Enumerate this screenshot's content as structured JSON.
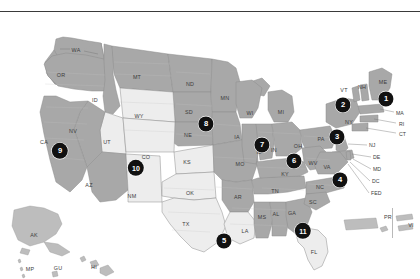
{
  "figure": {
    "colors": {
      "shaded_state_fill": "#a8a8a8",
      "unshaded_state_fill": "#ededed",
      "state_border": "#8c8c8c",
      "county_line": "#c9c9c9",
      "marker_fill": "#111111",
      "marker_text": "#ffffff",
      "background": "#ffffff",
      "rule": "#3a3a3a"
    }
  },
  "markers": [
    {
      "label": "1",
      "x": 386,
      "y": 87,
      "r": 7.6,
      "name": "region-marker-1"
    },
    {
      "label": "2",
      "x": 343,
      "y": 93,
      "r": 7.6,
      "name": "region-marker-2"
    },
    {
      "label": "3",
      "x": 337,
      "y": 125,
      "r": 7.6,
      "name": "region-marker-3"
    },
    {
      "label": "4",
      "x": 340,
      "y": 168,
      "r": 7.6,
      "name": "region-marker-4"
    },
    {
      "label": "5",
      "x": 224,
      "y": 229,
      "r": 7.6,
      "name": "region-marker-5"
    },
    {
      "label": "6",
      "x": 294,
      "y": 149,
      "r": 7.6,
      "name": "region-marker-6"
    },
    {
      "label": "7",
      "x": 262,
      "y": 133,
      "r": 7.6,
      "name": "region-marker-7"
    },
    {
      "label": "8",
      "x": 206,
      "y": 112,
      "r": 7.6,
      "name": "region-marker-8"
    },
    {
      "label": "9",
      "x": 60,
      "y": 139,
      "r": 8.2,
      "name": "region-marker-9"
    },
    {
      "label": "10",
      "x": 136,
      "y": 156,
      "r": 8.2,
      "name": "region-marker-10"
    },
    {
      "label": "11",
      "x": 303,
      "y": 219,
      "r": 8.2,
      "name": "region-marker-11"
    }
  ],
  "state_labels": [
    {
      "text": "WA",
      "x": 76,
      "y": 38
    },
    {
      "text": "OR",
      "x": 61,
      "y": 63
    },
    {
      "text": "ID",
      "x": 95,
      "y": 88
    },
    {
      "text": "MT",
      "x": 137,
      "y": 65
    },
    {
      "text": "ND",
      "x": 190,
      "y": 72
    },
    {
      "text": "SD",
      "x": 189,
      "y": 100
    },
    {
      "text": "NE",
      "x": 188,
      "y": 123
    },
    {
      "text": "MN",
      "x": 225,
      "y": 86
    },
    {
      "text": "WY",
      "x": 139,
      "y": 104
    },
    {
      "text": "UT",
      "x": 107,
      "y": 130
    },
    {
      "text": "NV",
      "x": 73,
      "y": 119
    },
    {
      "text": "CA",
      "x": 44,
      "y": 130
    },
    {
      "text": "AZ",
      "x": 89,
      "y": 173
    },
    {
      "text": "NM",
      "x": 132,
      "y": 184
    },
    {
      "text": "CO",
      "x": 146,
      "y": 145
    },
    {
      "text": "KS",
      "x": 187,
      "y": 150
    },
    {
      "text": "OK",
      "x": 190,
      "y": 181
    },
    {
      "text": "TX",
      "x": 186,
      "y": 212
    },
    {
      "text": "IA",
      "x": 237,
      "y": 125
    },
    {
      "text": "MO",
      "x": 240,
      "y": 152
    },
    {
      "text": "AR",
      "x": 238,
      "y": 185
    },
    {
      "text": "LA",
      "x": 245,
      "y": 219
    },
    {
      "text": "MS",
      "x": 262,
      "y": 205
    },
    {
      "text": "AL",
      "x": 276,
      "y": 202
    },
    {
      "text": "GA",
      "x": 292,
      "y": 201
    },
    {
      "text": "FL",
      "x": 314,
      "y": 240
    },
    {
      "text": "TN",
      "x": 275,
      "y": 179
    },
    {
      "text": "KY",
      "x": 285,
      "y": 162
    },
    {
      "text": "WI",
      "x": 250,
      "y": 101
    },
    {
      "text": "MI",
      "x": 281,
      "y": 100
    },
    {
      "text": "IL",
      "x": 259,
      "y": 140
    },
    {
      "text": "IN",
      "x": 274,
      "y": 138
    },
    {
      "text": "OH",
      "x": 298,
      "y": 134
    },
    {
      "text": "WV",
      "x": 313,
      "y": 151
    },
    {
      "text": "VA",
      "x": 327,
      "y": 155
    },
    {
      "text": "NC",
      "x": 320,
      "y": 175
    },
    {
      "text": "SC",
      "x": 313,
      "y": 190
    },
    {
      "text": "PA",
      "x": 321,
      "y": 127
    },
    {
      "text": "NY",
      "x": 349,
      "y": 110
    },
    {
      "text": "VT",
      "x": 344,
      "y": 78
    },
    {
      "text": "NH",
      "x": 362,
      "y": 75
    },
    {
      "text": "ME",
      "x": 383,
      "y": 70
    },
    {
      "text": "AK",
      "x": 34,
      "y": 223
    },
    {
      "text": "HI",
      "x": 94,
      "y": 255
    },
    {
      "text": "MP",
      "x": 30,
      "y": 257
    },
    {
      "text": "GU",
      "x": 58,
      "y": 256
    },
    {
      "text": "PR",
      "x": 388,
      "y": 205
    },
    {
      "text": "VI",
      "x": 411,
      "y": 213
    }
  ],
  "leader_labels": [
    {
      "text": "MA",
      "x": 396,
      "y": 101,
      "name": "leader-label-ma"
    },
    {
      "text": "RI",
      "x": 399,
      "y": 112,
      "name": "leader-label-ri"
    },
    {
      "text": "CT",
      "x": 399,
      "y": 122,
      "name": "leader-label-ct"
    },
    {
      "text": "NJ",
      "x": 369,
      "y": 133,
      "name": "leader-label-nj"
    },
    {
      "text": "DE",
      "x": 373,
      "y": 145,
      "name": "leader-label-de"
    },
    {
      "text": "MD",
      "x": 373,
      "y": 157,
      "name": "leader-label-md"
    },
    {
      "text": "DC",
      "x": 372,
      "y": 169,
      "name": "leader-label-dc"
    },
    {
      "text": "FED",
      "x": 371,
      "y": 181,
      "name": "leader-label-fed"
    }
  ]
}
